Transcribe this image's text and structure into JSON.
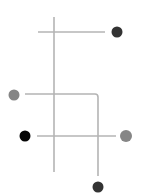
{
  "diagram": {
    "background": "#ffffff",
    "line_color": "#b4b4b4",
    "lines": [
      {
        "id": "main-vertical",
        "type": "line",
        "x1": 54,
        "y1": 17,
        "x2": 54,
        "y2": 172
      },
      {
        "id": "top-horizontal",
        "type": "line",
        "x1": 38,
        "y1": 32,
        "x2": 105,
        "y2": 32
      },
      {
        "id": "middle-elbow",
        "type": "path",
        "d": "M25 94 L95 94 Q98 94 98 97 L98 176"
      },
      {
        "id": "bottom-horizontal",
        "type": "line",
        "x1": 37,
        "y1": 136,
        "x2": 116,
        "y2": 136
      }
    ],
    "nodes": [
      {
        "id": "node-top-right",
        "cx": 117,
        "cy": 32,
        "r": 5.5,
        "color": "#333333"
      },
      {
        "id": "node-middle-left",
        "cx": 14,
        "cy": 95,
        "r": 5.5,
        "color": "#858585"
      },
      {
        "id": "node-bottom-left",
        "cx": 25,
        "cy": 136,
        "r": 5.5,
        "color": "#050505"
      },
      {
        "id": "node-bottom-right",
        "cx": 126,
        "cy": 136,
        "r": 6,
        "color": "#868686"
      },
      {
        "id": "node-bottom",
        "cx": 98,
        "cy": 187,
        "r": 5.5,
        "color": "#333333"
      }
    ]
  }
}
